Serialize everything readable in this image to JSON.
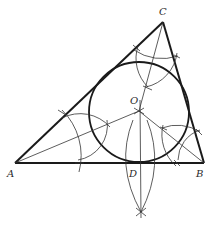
{
  "diagram": {
    "points": {
      "A": {
        "label": "A",
        "x": 15,
        "y": 163
      },
      "B": {
        "label": "B",
        "x": 204,
        "y": 163
      },
      "C": {
        "label": "C",
        "x": 163,
        "y": 22
      },
      "O": {
        "label": "O",
        "x": 139,
        "y": 111
      },
      "D": {
        "label": "D",
        "x": 139,
        "y": 163
      }
    },
    "incircle": {
      "cx": 139,
      "cy": 112,
      "r": 50
    },
    "colors": {
      "ink": "#1a1a1a",
      "background": "#ffffff"
    }
  }
}
